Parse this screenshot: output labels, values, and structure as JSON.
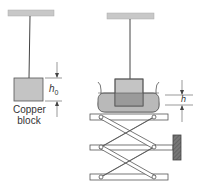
{
  "figure": {
    "left_setup": {
      "label_line1": "Copper",
      "label_line2": "block",
      "dimension_symbol": "h",
      "dimension_subscript": "0"
    },
    "right_setup": {
      "dimension_symbol": "h"
    }
  },
  "colors": {
    "ceiling": "#c8c8c8",
    "block": "#c4c4c4",
    "water": "#b9b9b9",
    "submerged_block": "#9a9a9a",
    "lines": "#444444",
    "handle": "#6a6a6a"
  }
}
